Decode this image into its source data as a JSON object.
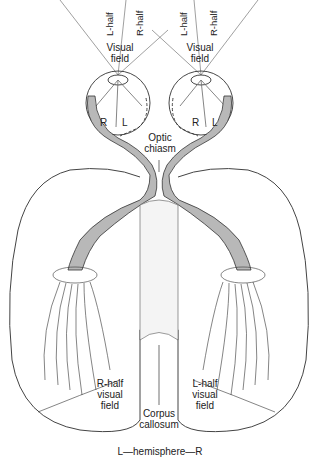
{
  "diagram": {
    "type": "visual pathway anatomy",
    "labels": {
      "left_eye_l_half": "L-half",
      "left_eye_r_half": "R-half",
      "right_eye_l_half": "L-half",
      "right_eye_r_half": "R-half",
      "visual_field_left": "Visual field",
      "visual_field_right": "Visual field",
      "left_eye_retina_r": "R",
      "left_eye_retina_l": "L",
      "right_eye_retina_r": "R",
      "right_eye_retina_l": "L",
      "optic_chiasm": "Optic chiasm",
      "r_half_visual_field": "R-half visual field",
      "l_half_visual_field": "L-half visual field",
      "corpus_callosum": "Corpus callosum",
      "hemispheres": "L—hemisphere—R"
    },
    "colors": {
      "line": "#333333",
      "tract_fill": "#b8b8b8",
      "stipple": "#888888"
    }
  }
}
